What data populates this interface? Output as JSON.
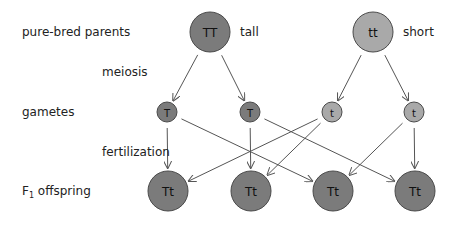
{
  "labels": {
    "parents": "pure-bred parents",
    "meiosis": "meiosis",
    "gametes": "gametes",
    "fertilization": "fertilization",
    "offspring_prefix": "F",
    "offspring_sub": "1",
    "offspring_suffix": " offspring",
    "tall": "tall",
    "short": "short"
  },
  "colors": {
    "dominant": "#7b7b7b",
    "recessive": "#a9a9a9",
    "stroke": "#4a4a4a",
    "arrow": "#555555"
  },
  "parents": [
    {
      "id": "P1",
      "genotype": "TT",
      "phenotype": "tall",
      "x": 210,
      "y": 32,
      "r": 20,
      "type": "dominant"
    },
    {
      "id": "P2",
      "genotype": "tt",
      "phenotype": "short",
      "x": 373,
      "y": 32,
      "r": 20,
      "type": "recessive"
    }
  ],
  "gametes": [
    {
      "id": "G1",
      "allele": "T",
      "x": 167,
      "y": 112,
      "r": 10,
      "type": "dominant"
    },
    {
      "id": "G2",
      "allele": "T",
      "x": 250,
      "y": 112,
      "r": 10,
      "type": "dominant"
    },
    {
      "id": "G3",
      "allele": "t",
      "x": 332,
      "y": 112,
      "r": 10,
      "type": "recessive"
    },
    {
      "id": "G4",
      "allele": "t",
      "x": 414,
      "y": 112,
      "r": 10,
      "type": "recessive"
    }
  ],
  "offspring": [
    {
      "id": "F1",
      "genotype": "Tt",
      "x": 168,
      "y": 191,
      "r": 20,
      "type": "dominant"
    },
    {
      "id": "F2",
      "genotype": "Tt",
      "x": 251,
      "y": 191,
      "r": 20,
      "type": "dominant"
    },
    {
      "id": "F3",
      "genotype": "Tt",
      "x": 333,
      "y": 191,
      "r": 20,
      "type": "dominant"
    },
    {
      "id": "F4",
      "genotype": "Tt",
      "x": 415,
      "y": 191,
      "r": 20,
      "type": "dominant"
    }
  ],
  "edges": [
    {
      "from": "P1",
      "to": "G1"
    },
    {
      "from": "P1",
      "to": "G2"
    },
    {
      "from": "P2",
      "to": "G3"
    },
    {
      "from": "P2",
      "to": "G4"
    },
    {
      "from": "G1",
      "to": "F1"
    },
    {
      "from": "G1",
      "to": "F3"
    },
    {
      "from": "G2",
      "to": "F2"
    },
    {
      "from": "G2",
      "to": "F4"
    },
    {
      "from": "G3",
      "to": "F1"
    },
    {
      "from": "G3",
      "to": "F2"
    },
    {
      "from": "G4",
      "to": "F3"
    },
    {
      "from": "G4",
      "to": "F4"
    }
  ]
}
